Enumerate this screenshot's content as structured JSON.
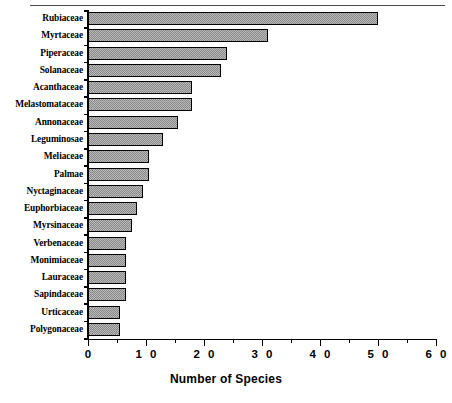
{
  "chart_data": {
    "type": "bar",
    "orientation": "horizontal",
    "title": "",
    "xlabel": "Number of Species",
    "ylabel": "",
    "xlim": [
      0,
      60
    ],
    "xticks": [
      0,
      10,
      20,
      30,
      40,
      50,
      60
    ],
    "xticklabels": [
      "0",
      "1 0",
      "2 0",
      "3 0",
      "4 0",
      "5 0",
      "6 0"
    ],
    "minor_xticks": [
      5,
      15,
      25,
      35,
      45,
      55
    ],
    "grid": false,
    "legend": null,
    "categories": [
      "Rubiaceae",
      "Myrtaceae",
      "Piperaceae",
      "Solanaceae",
      "Acanthaceae",
      "Melastomataceae",
      "Annonaceae",
      "Leguminosae",
      "Meliaceae",
      "Palmae",
      "Nyctaginaceae",
      "Euphorbiaceae",
      "Myrsinaceae",
      "Verbenaceae",
      "Monimiaceae",
      "Lauraceae",
      "Sapindaceae",
      "Urticaceae",
      "Polygonaceae"
    ],
    "values": [
      50,
      31,
      24,
      23,
      18,
      18,
      15.5,
      13,
      10.5,
      10.5,
      9.5,
      8.5,
      7.5,
      6.5,
      6.5,
      6.5,
      6.5,
      5.5,
      5.5
    ],
    "bar_fill_color": "#8a8a8a",
    "bar_edge_color": "#000000"
  },
  "axis": {
    "x_title": "Number of Species"
  }
}
